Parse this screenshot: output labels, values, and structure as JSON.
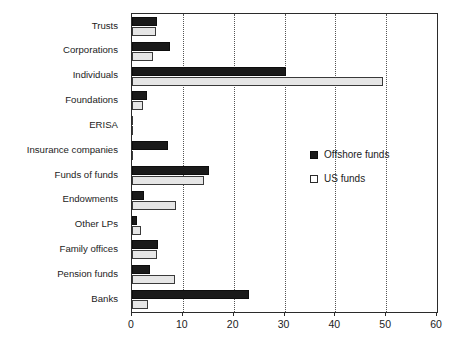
{
  "chart_data": {
    "type": "bar",
    "orientation": "horizontal",
    "title": "",
    "xlabel": "",
    "ylabel": "",
    "xlim": [
      0,
      60
    ],
    "xticks": [
      0,
      10,
      20,
      30,
      40,
      50,
      60
    ],
    "xtick_labels": [
      "0",
      "10",
      "20",
      "30",
      "40",
      "50",
      "60"
    ],
    "grid": "vertical-dotted",
    "legend_position": "middle-right",
    "categories": [
      "Trusts",
      "Corporations",
      "Individuals",
      "Foundations",
      "ERISA",
      "Insurance companies",
      "Funds of funds",
      "Endowments",
      "Other LPs",
      "Family offices",
      "Pension funds",
      "Banks"
    ],
    "series": [
      {
        "name": "Offshore funds",
        "color": "#1a1a1a",
        "values": [
          4.9,
          7.5,
          30.3,
          2.9,
          0.0,
          7.1,
          15.2,
          2.3,
          1.0,
          5.2,
          3.5,
          23.0
        ]
      },
      {
        "name": "US funds",
        "color": "#e6e6e6",
        "values": [
          4.7,
          4.1,
          49.4,
          2.2,
          0.0,
          0.2,
          14.2,
          8.7,
          1.8,
          5.0,
          8.5,
          3.1
        ]
      }
    ]
  },
  "legend": {
    "items": [
      {
        "label": "Offshore funds",
        "swatch": "filled-black-square"
      },
      {
        "label": "US funds",
        "swatch": "open-white-square"
      }
    ]
  },
  "caption": ""
}
